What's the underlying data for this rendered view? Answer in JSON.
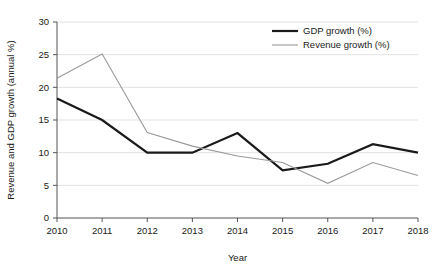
{
  "chart_data": {
    "type": "line",
    "title": "",
    "xlabel": "Year",
    "ylabel": "Revenue and GDP growth (annual %)",
    "categories": [
      "2010",
      "2011",
      "2012",
      "2013",
      "2014",
      "2015",
      "2016",
      "2017",
      "2018"
    ],
    "x": [
      2010,
      2011,
      2012,
      2013,
      2014,
      2015,
      2016,
      2017,
      2018
    ],
    "series": [
      {
        "name": "GDP growth (%)",
        "color": "#1a1a1a",
        "width": 2.2,
        "values": [
          18.3,
          15.0,
          10.0,
          10.0,
          13.0,
          7.3,
          8.3,
          11.3,
          10.0
        ]
      },
      {
        "name": "Revenue growth (%)",
        "color": "#9a9a9a",
        "width": 1.1,
        "values": [
          21.4,
          25.1,
          13.1,
          11.0,
          9.5,
          8.5,
          5.3,
          8.5,
          6.5
        ]
      }
    ],
    "ylim": [
      0,
      30
    ],
    "yticks": [
      0,
      5,
      10,
      15,
      20,
      25,
      30
    ],
    "ytick_labels": [
      "0",
      "5",
      "10",
      "15",
      "20",
      "25",
      "30"
    ],
    "xlim": [
      2010,
      2018
    ],
    "grid": "horizontal",
    "grid_color": "#e3e3e3",
    "legend_position": "top-right",
    "axis_color": "#555555",
    "background": "#ffffff"
  }
}
